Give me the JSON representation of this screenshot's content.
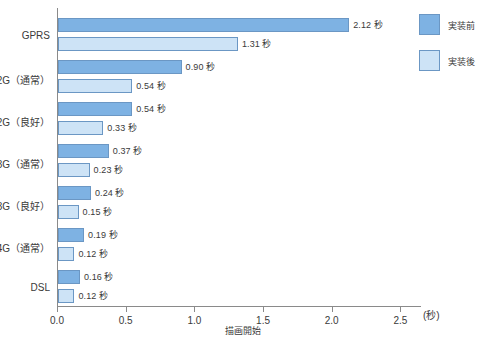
{
  "chart_data": {
    "type": "bar",
    "orientation": "horizontal",
    "title": "",
    "xlabel": "描画開始",
    "ylabel": "",
    "unit_label": "(秒)",
    "xlim": [
      0.0,
      2.65
    ],
    "xticks": [
      0.0,
      0.5,
      1.0,
      1.5,
      2.0,
      2.5
    ],
    "xticklabels": [
      "0.0",
      "0.5",
      "1.0",
      "1.5",
      "2.0",
      "2.5"
    ],
    "grid": false,
    "legend_position": "right-top",
    "categories": [
      "GPRS",
      "2G（通常）",
      "2G（良好）",
      "3G（通常）",
      "3G（良好）",
      "4G（通常）",
      "DSL"
    ],
    "series": [
      {
        "name": "実装前",
        "color": "#7eb2e3",
        "border": "#6b97c4",
        "values": [
          2.12,
          0.9,
          0.54,
          0.37,
          0.24,
          0.19,
          0.16
        ],
        "labels": [
          "2.12 秒",
          "0.90 秒",
          "0.54 秒",
          "0.37 秒",
          "0.24 秒",
          "0.19 秒",
          "0.16 秒"
        ]
      },
      {
        "name": "実装後",
        "color": "#cde3f6",
        "border": "#6b97c4",
        "values": [
          1.31,
          0.54,
          0.33,
          0.23,
          0.15,
          0.12,
          0.12
        ],
        "labels": [
          "1.31 秒",
          "0.54 秒",
          "0.33 秒",
          "0.23 秒",
          "0.15 秒",
          "0.12 秒",
          "0.12 秒"
        ]
      }
    ]
  },
  "legend": {
    "items": [
      {
        "label": "実装前",
        "color": "#7eb2e3"
      },
      {
        "label": "実装後",
        "color": "#cde3f6"
      }
    ]
  },
  "axis": {
    "x_title": "描画開始",
    "unit": "(秒)",
    "ticks": [
      "0.0",
      "0.5",
      "1.0",
      "1.5",
      "2.0",
      "2.5"
    ]
  },
  "categories": [
    "GPRS",
    "2G（通常）",
    "2G（良好）",
    "3G（通常）",
    "3G（良好）",
    "4G（通常）",
    "DSL"
  ],
  "colors": {
    "before": "#7eb2e3",
    "after": "#cde3f6",
    "bar_border": "#6b97c4",
    "axis": "#8a8a8a",
    "text": "#3a3a3a",
    "background": "#ffffff"
  }
}
